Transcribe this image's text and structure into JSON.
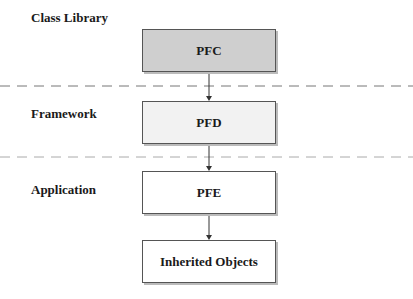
{
  "layers": [
    {
      "label": "Class Library"
    },
    {
      "label": "Framework"
    },
    {
      "label": "Application"
    }
  ],
  "boxes": [
    {
      "label": "PFC",
      "fill": "#cfcfcf"
    },
    {
      "label": "PFD",
      "fill": "#f2f2f2"
    },
    {
      "label": "PFE",
      "fill": "#ffffff"
    },
    {
      "label": "Inherited Objects",
      "fill": "#ffffff"
    }
  ]
}
